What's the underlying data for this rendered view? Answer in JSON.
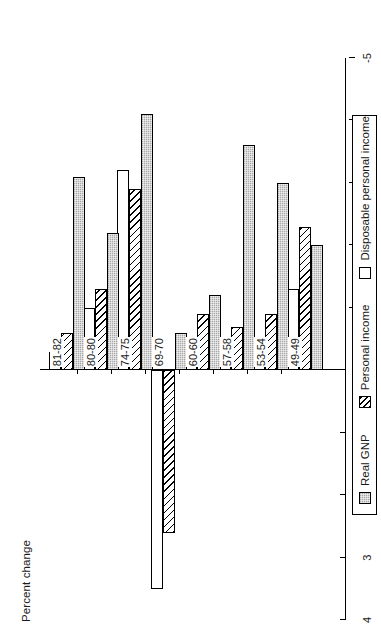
{
  "chart_data": {
    "type": "bar",
    "orientation": "horizontal",
    "title": "",
    "xlabel": "",
    "ylabel": "Percent change",
    "categories": [
      "49-49",
      "53-54",
      "57-58",
      "60-60",
      "69-70",
      "74-75",
      "80-80",
      "81-82"
    ],
    "series": [
      {
        "name": "Real GNP",
        "key": "gnp",
        "fill": "stippled-gray",
        "color": "#a8a8a8",
        "values": [
          -2.0,
          -3.0,
          -3.6,
          -1.2,
          -0.6,
          -4.1,
          -2.2,
          -3.1
        ]
      },
      {
        "name": "Personal income",
        "key": "pi",
        "fill": "diagonal-hatch",
        "color": "#ffffff",
        "values": [
          -2.3,
          -0.9,
          -0.7,
          -0.9,
          2.6,
          -2.9,
          -1.3,
          -0.6
        ]
      },
      {
        "name": "Disposable personal income",
        "key": "dpi",
        "fill": "open-white",
        "color": "#ffffff",
        "values": [
          -1.3,
          -0.5,
          -0.5,
          -0.5,
          3.5,
          -3.2,
          -1.0,
          -0.3
        ]
      }
    ],
    "axis": {
      "min": 4,
      "max": -5,
      "tick_labels": [
        "4",
        "3",
        "2",
        "1",
        "0",
        "-1",
        "-2",
        "-3",
        "-4",
        "-5"
      ],
      "tick_values": [
        4,
        3,
        2,
        1,
        0,
        -1,
        -2,
        -3,
        -4,
        -5
      ],
      "grid": false,
      "direction": "negative-right"
    },
    "legend": {
      "position": "bottom",
      "entries": [
        "Real GNP",
        "Personal income",
        "Disposable personal income"
      ]
    }
  },
  "legend": {
    "items": [
      {
        "label": "Real GNP"
      },
      {
        "label": "Personal income"
      },
      {
        "label": "Disposable personal income"
      }
    ]
  },
  "axis": {
    "caption": "Percent change"
  }
}
